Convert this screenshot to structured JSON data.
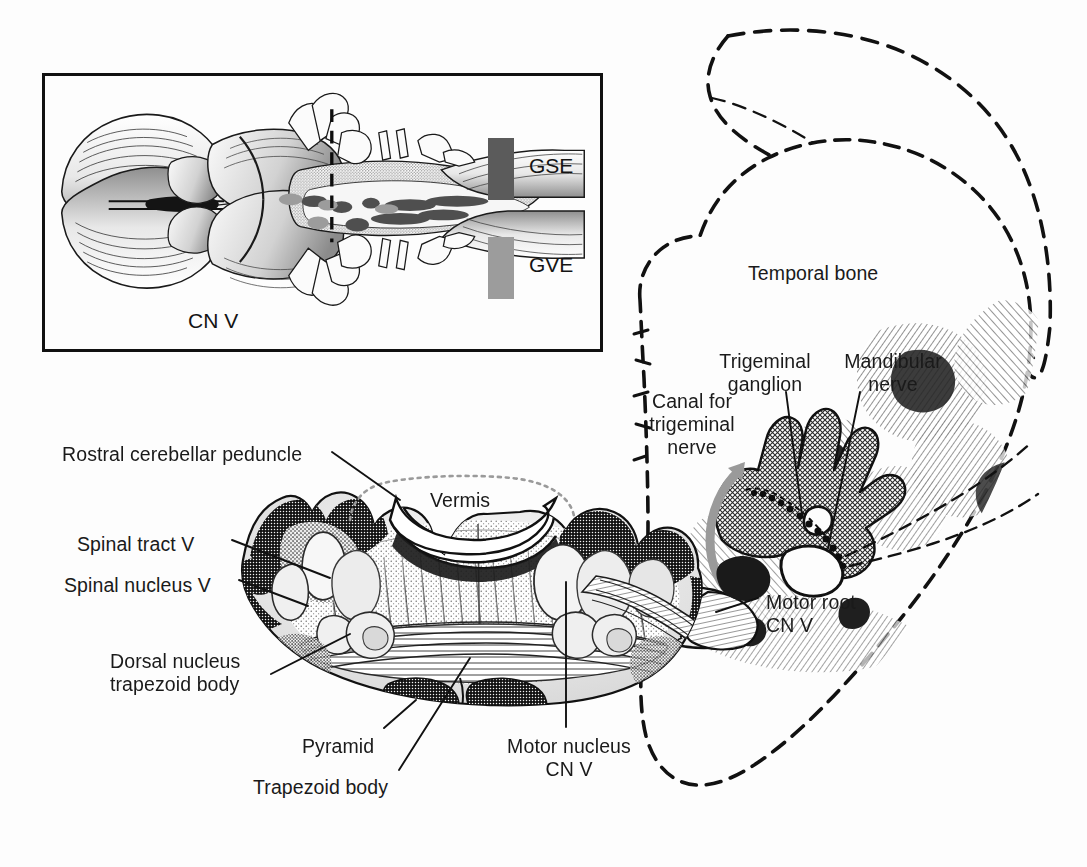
{
  "figure": {
    "background_color": "#fdfdfd",
    "ink_color": "#111111"
  },
  "inset": {
    "name": "brainstem-dorsal-view-inset",
    "section_line_label": "section-level-dashed-line",
    "cn_label": "CN V",
    "legend": {
      "items": [
        {
          "key": "GSE",
          "label": "GSE",
          "color": "#5b5b5b"
        },
        {
          "key": "GVE",
          "label": "GVE",
          "color": "#9c9c9c"
        }
      ]
    }
  },
  "main": {
    "section_name": "pons-cross-section",
    "skull_name": "temporal-bone-outline",
    "labels": [
      {
        "id": "rostral-cerebellar-peduncle",
        "text": "Rostral cerebellar peduncle",
        "x": 62,
        "y": 443,
        "align": "left"
      },
      {
        "id": "spinal-tract-v",
        "text": "Spinal tract V",
        "x": 77,
        "y": 533,
        "align": "left"
      },
      {
        "id": "spinal-nucleus-v",
        "text": "Spinal nucleus V",
        "x": 64,
        "y": 574,
        "align": "left"
      },
      {
        "id": "vermis",
        "text": "Vermis",
        "x": 430,
        "y": 489,
        "align": "left"
      },
      {
        "id": "dorsal-nucleus-trapezoid-body",
        "text": "Dorsal nucleus\ntrapezoid body",
        "x": 110,
        "y": 650,
        "align": "left"
      },
      {
        "id": "pyramid",
        "text": "Pyramid",
        "x": 302,
        "y": 735,
        "align": "left"
      },
      {
        "id": "trapezoid-body",
        "text": "Trapezoid body",
        "x": 253,
        "y": 776,
        "align": "left"
      },
      {
        "id": "motor-nucleus-cn-v",
        "text": "Motor nucleus\nCN V",
        "x": 489,
        "y": 735,
        "align": "left"
      },
      {
        "id": "temporal-bone",
        "text": "Temporal bone",
        "x": 748,
        "y": 262,
        "align": "left"
      },
      {
        "id": "trigeminal-ganglion",
        "text": "Trigeminal\nganglion",
        "x": 708,
        "y": 350,
        "align": "center"
      },
      {
        "id": "mandibular-nerve",
        "text": "Mandibular\nnerve",
        "x": 832,
        "y": 350,
        "align": "center"
      },
      {
        "id": "canal-for-trigeminal-nerve",
        "text": "Canal for\ntrigeminal\nnerve",
        "x": 655,
        "y": 390,
        "align": "center"
      },
      {
        "id": "motor-root-cn-v",
        "text": "Motor root\nCN V",
        "x": 766,
        "y": 591,
        "align": "left"
      }
    ]
  }
}
